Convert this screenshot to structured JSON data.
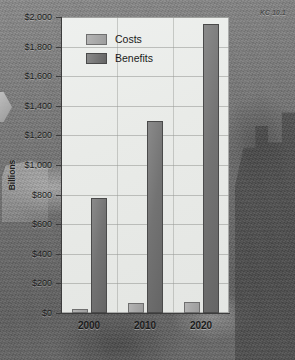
{
  "figure": {
    "note": "KC 10.1"
  },
  "chart_data": {
    "type": "bar",
    "title": "",
    "xlabel": "",
    "ylabel": "Billions",
    "categories": [
      "2000",
      "2010",
      "2020"
    ],
    "series": [
      {
        "name": "Costs",
        "values": [
          25,
          65,
          75
        ],
        "color": "#a8a8a8"
      },
      {
        "name": "Benefits",
        "values": [
          775,
          1300,
          1950
        ],
        "color": "#737373"
      }
    ],
    "ylim": [
      0,
      2000
    ],
    "ytick_labels": [
      "$2,000",
      "$1,800",
      "$1,600",
      "$1,400",
      "$1,200",
      "$1,000",
      "$800",
      "$600",
      "$400",
      "$200",
      "$0"
    ],
    "ytick_values": [
      2000,
      1800,
      1600,
      1400,
      1200,
      1000,
      800,
      600,
      400,
      200,
      0
    ],
    "grid": true,
    "legend_position": "top-left"
  }
}
